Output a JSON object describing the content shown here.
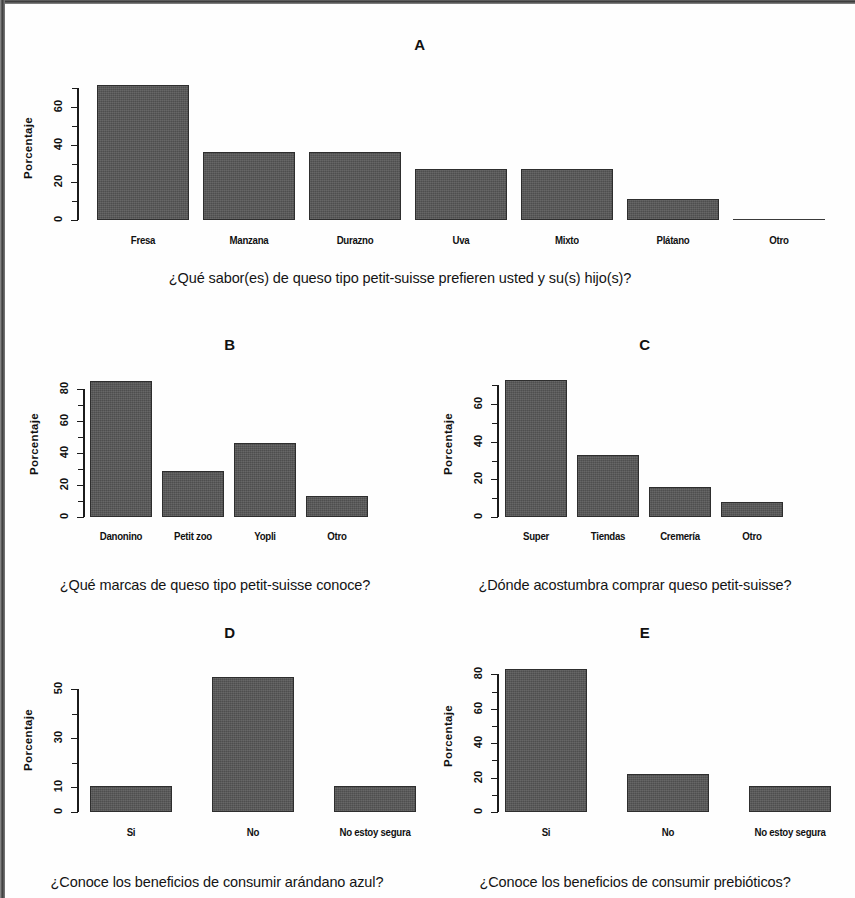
{
  "page": {
    "ylabel": "Porcentaje"
  },
  "panels": [
    {
      "letter": "A",
      "caption": "¿Qué sabor(es) de queso tipo petit-suisse prefieren usted y su(s) hijo(s)?",
      "ticklabels": [
        "0",
        "20",
        "40",
        "60"
      ]
    },
    {
      "letter": "B",
      "caption": "¿Qué marcas de queso tipo petit-suisse conoce?",
      "ticklabels": [
        "0",
        "20",
        "40",
        "60",
        "80"
      ]
    },
    {
      "letter": "C",
      "caption": "¿Dónde acostumbra comprar queso petit-suisse?",
      "ticklabels": [
        "0",
        "20",
        "40",
        "60"
      ]
    },
    {
      "letter": "D",
      "caption": "¿Conoce los beneficios de consumir  arándano azul?",
      "ticklabels": [
        "0",
        "10",
        "30",
        "50"
      ]
    },
    {
      "letter": "E",
      "caption": "¿Conoce los beneficios de consumir prebióticos?",
      "ticklabels": [
        "0",
        "20",
        "40",
        "60",
        "80"
      ]
    }
  ],
  "colors": {
    "bar_fill": "#575757",
    "bar_stroke": "#2e2e2e",
    "axis": "#1b1b1b",
    "text": "#111111",
    "background": "#fefefe"
  },
  "chart_data": [
    {
      "type": "bar",
      "title": "A",
      "xlabel": "",
      "ylabel": "Porcentaje",
      "caption": "¿Qué sabor(es) de queso tipo petit-suisse prefieren usted y su(s) hijo(s)?",
      "categories": [
        "Fresa",
        "Manzana",
        "Durazno",
        "Uva",
        "Mixto",
        "Plátano",
        "Otro"
      ],
      "values": [
        72,
        36,
        36,
        27,
        27,
        11,
        0.5
      ],
      "ylim": [
        0,
        75
      ],
      "yticks": [
        0,
        20,
        40,
        60
      ],
      "yticks_minor": [
        10,
        30,
        50,
        70
      ],
      "grid": false,
      "legend": "none"
    },
    {
      "type": "bar",
      "title": "B",
      "xlabel": "",
      "ylabel": "Porcentaje",
      "caption": "¿Qué marcas de queso tipo petit-suisse conoce?",
      "categories": [
        "Danonino",
        "Petit zoo",
        "Yopli",
        "Otro"
      ],
      "values": [
        85,
        29,
        46,
        13
      ],
      "ylim": [
        0,
        88
      ],
      "yticks": [
        0,
        20,
        40,
        60,
        80
      ],
      "yticks_minor": [
        10,
        30,
        50,
        70
      ],
      "grid": false,
      "legend": "none"
    },
    {
      "type": "bar",
      "title": "C",
      "xlabel": "",
      "ylabel": "Porcentaje",
      "caption": "¿Dónde acostumbra comprar queso petit-suisse?",
      "categories": [
        "Super",
        "Tiendas",
        "Cremería",
        "Otro"
      ],
      "values": [
        73,
        33,
        16,
        8
      ],
      "ylim": [
        0,
        75
      ],
      "yticks": [
        0,
        20,
        40,
        60
      ],
      "yticks_minor": [
        10,
        30,
        50,
        70
      ],
      "grid": false,
      "legend": "none"
    },
    {
      "type": "bar",
      "title": "D",
      "xlabel": "",
      "ylabel": "Porcentaje",
      "caption": "¿Conoce los beneficios de consumir  arándano azul?",
      "categories": [
        "Si",
        "No",
        "No estoy segura"
      ],
      "values": [
        10.5,
        55,
        10.5
      ],
      "ylim": [
        0,
        57
      ],
      "yticks": [
        0,
        10,
        30,
        50
      ],
      "yticks_minor": [
        20,
        40
      ],
      "grid": false,
      "legend": "none"
    },
    {
      "type": "bar",
      "title": "E",
      "xlabel": "",
      "ylabel": "Porcentaje",
      "caption": "¿Conoce los beneficios de consumir prebióticos?",
      "categories": [
        "Si",
        "No",
        "No estoy segura"
      ],
      "values": [
        83,
        22,
        15
      ],
      "ylim": [
        0,
        86
      ],
      "yticks": [
        0,
        20,
        40,
        60,
        80
      ],
      "yticks_minor": [
        10,
        30,
        50,
        70
      ],
      "grid": false,
      "legend": "none"
    }
  ]
}
